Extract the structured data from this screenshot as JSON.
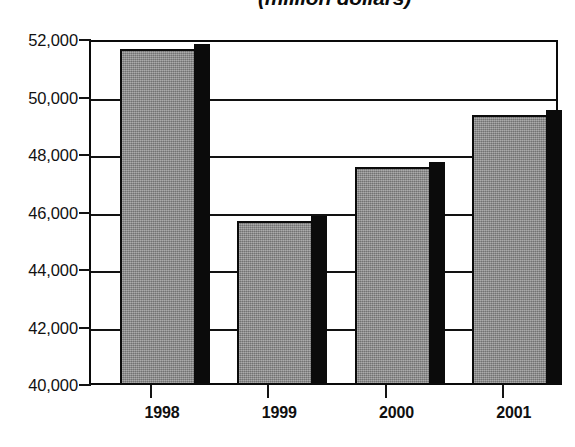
{
  "chart_data": {
    "type": "bar",
    "title": "(million dollars)",
    "xlabel": "",
    "ylabel": "",
    "categories": [
      "1998",
      "1999",
      "2000",
      "2001"
    ],
    "values": [
      51700,
      45700,
      47600,
      49400
    ],
    "ylim": [
      40000,
      52000
    ],
    "ytick_step": 2000,
    "ytick_labels": [
      "52,000",
      "50,000",
      "48,000",
      "46,000",
      "44,000",
      "42,000",
      "40,000"
    ],
    "ytick_values": [
      52000,
      50000,
      48000,
      46000,
      44000,
      42000,
      40000
    ],
    "grid": true,
    "legend": false,
    "legend_position": "none",
    "bar_style": {
      "fill_color": "#8c8c8c",
      "edge_color": "#0b0b0b",
      "shadow_color": "#0b0b0b",
      "three_d": true
    },
    "frame_color": "#0a0a0a",
    "background": "#ffffff"
  },
  "axis": {
    "y_ticks": [
      {
        "label": "52,000",
        "value": 52000
      },
      {
        "label": "50,000",
        "value": 50000
      },
      {
        "label": "48,000",
        "value": 48000
      },
      {
        "label": "46,000",
        "value": 46000
      },
      {
        "label": "44,000",
        "value": 44000
      },
      {
        "label": "42,000",
        "value": 42000
      },
      {
        "label": "40,000",
        "value": 40000
      }
    ],
    "x_ticks": [
      {
        "label": "1998"
      },
      {
        "label": "1999"
      },
      {
        "label": "2000"
      },
      {
        "label": "2001"
      }
    ]
  }
}
